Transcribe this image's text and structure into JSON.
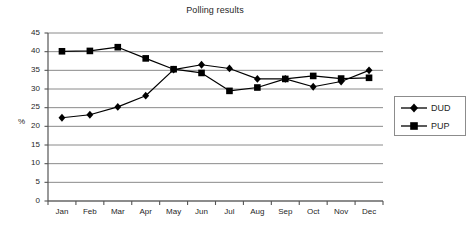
{
  "chart_data": {
    "type": "line",
    "title": "Polling results",
    "xlabel": "",
    "ylabel": "%",
    "categories": [
      "Jan",
      "Feb",
      "Mar",
      "Apr",
      "May",
      "Jun",
      "Jul",
      "Aug",
      "Sep",
      "Oct",
      "Nov",
      "Dec"
    ],
    "series": [
      {
        "name": "DUD",
        "marker": "diamond",
        "color": "#000000",
        "values": [
          22.3,
          23.1,
          25.2,
          28.2,
          35.2,
          36.5,
          35.5,
          32.7,
          32.7,
          30.6,
          32.0,
          35.0
        ]
      },
      {
        "name": "PUP",
        "marker": "square",
        "color": "#000000",
        "values": [
          40.1,
          40.2,
          41.2,
          38.2,
          35.3,
          34.3,
          29.5,
          30.4,
          32.7,
          33.5,
          32.8,
          33.0
        ]
      }
    ],
    "ylim": [
      0,
      45
    ],
    "ytick_step": 5,
    "yticks": [
      "45",
      "40",
      "35",
      "30",
      "25",
      "20",
      "15",
      "10",
      "5",
      "0"
    ],
    "grid": true,
    "grid_axis": "y",
    "legend_position": "right",
    "legend_entries": [
      "DUD",
      "PUP"
    ],
    "axis_color": "#555555",
    "grid_color": "#8a8a8a",
    "background": "#ffffff"
  }
}
